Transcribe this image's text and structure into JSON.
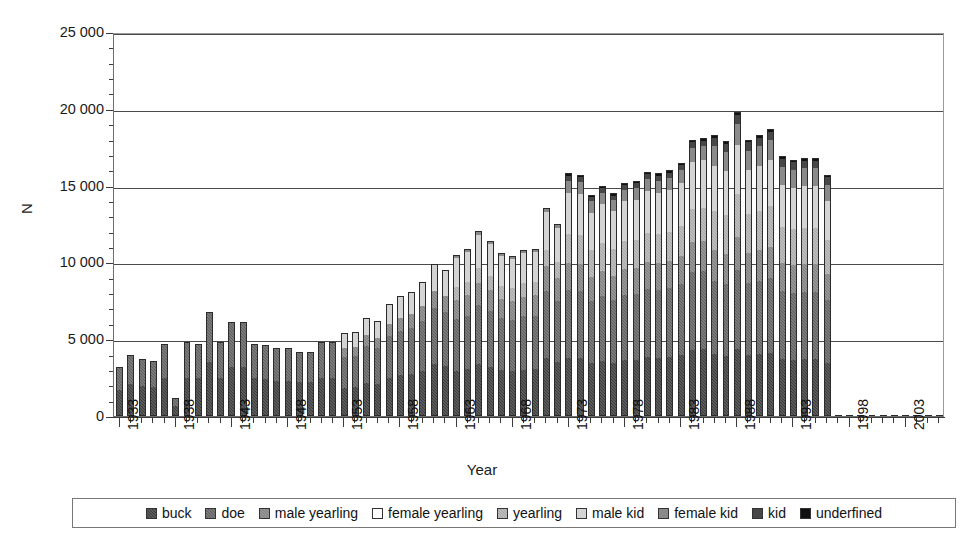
{
  "chart_data": {
    "type": "bar",
    "stacked": true,
    "title": "",
    "xlabel": "Year",
    "ylabel": "N",
    "ylim": [
      0,
      25000
    ],
    "ytick_major_step": 5000,
    "ytick_minor_step": 1000,
    "ytick_labels": [
      "0",
      "5 000",
      "10 000",
      "15 000",
      "20 000",
      "25 000"
    ],
    "grid": "horizontal",
    "legend_position": "bottom",
    "xtick_labels": [
      "1933",
      "1938",
      "1943",
      "1948",
      "1953",
      "1958",
      "1963",
      "1968",
      "1973",
      "1978",
      "1983",
      "1988",
      "1993",
      "1998",
      "2003"
    ],
    "xtick_label_step": 5,
    "x_start": 1933,
    "x_end": 2006,
    "series": [
      {
        "name": "buck",
        "key": "buck",
        "color": "#3b3b3b"
      },
      {
        "name": "doe",
        "key": "doe",
        "color": "#5e5e5e"
      },
      {
        "name": "male yearling",
        "key": "male-yearling",
        "color": "#7d7d7d"
      },
      {
        "name": "female yearling",
        "key": "female-yearling",
        "color": "#ffffff"
      },
      {
        "name": "yearling",
        "key": "yearling",
        "color": "#a7a7a7"
      },
      {
        "name": "male kid",
        "key": "male-kid",
        "color": "#d4d4d4"
      },
      {
        "name": "female kid",
        "key": "female-kid",
        "color": "#8a8a8a"
      },
      {
        "name": "kid",
        "key": "kid",
        "color": "#474747"
      },
      {
        "name": "underfined",
        "key": "underfined",
        "color": "#111111"
      }
    ],
    "categories": [
      1933,
      1934,
      1935,
      1936,
      1937,
      1938,
      1939,
      1940,
      1941,
      1942,
      1943,
      1944,
      1945,
      1946,
      1947,
      1948,
      1949,
      1950,
      1951,
      1952,
      1953,
      1954,
      1955,
      1956,
      1957,
      1958,
      1959,
      1960,
      1961,
      1962,
      1963,
      1964,
      1965,
      1966,
      1967,
      1968,
      1969,
      1970,
      1971,
      1972,
      1973,
      1974,
      1975,
      1976,
      1977,
      1978,
      1979,
      1980,
      1981,
      1982,
      1983,
      1984,
      1985,
      1986,
      1987,
      1988,
      1989,
      1990,
      1991,
      1992,
      1993,
      1994,
      1995,
      1996,
      1997,
      1998,
      1999,
      2000,
      2001,
      2002,
      2003,
      2004,
      2005,
      2006
    ],
    "totals": [
      3200,
      4000,
      3700,
      3600,
      4700,
      1200,
      4800,
      4700,
      6800,
      4800,
      6100,
      6100,
      4700,
      4600,
      4400,
      4400,
      4200,
      4200,
      4800,
      4800,
      5400,
      5500,
      6400,
      6200,
      7300,
      7800,
      8100,
      8700,
      9900,
      9500,
      10500,
      10900,
      12050,
      11400,
      10600,
      10400,
      10800,
      10900,
      13550,
      12500,
      15800,
      15700,
      14400,
      15000,
      14500,
      15200,
      15300,
      15900,
      15800,
      16000,
      16500,
      18000,
      18100,
      18300,
      17900,
      19800,
      18000,
      18300,
      18700,
      16900,
      16700,
      16800,
      16800,
      15700
    ],
    "note": "totals are stacked sums read off the y-axis; segment splits estimated per bar",
    "segments_description": "dark lower portion = buck/doe/yearling classes; light upper cap = kid classes; black tip = underfined"
  },
  "legend": {
    "items": [
      {
        "label": "buck",
        "key": "buck"
      },
      {
        "label": "doe",
        "key": "doe"
      },
      {
        "label": "male yearling",
        "key": "male-yearling"
      },
      {
        "label": "female yearling",
        "key": "female-yearling"
      },
      {
        "label": "yearling",
        "key": "yearling"
      },
      {
        "label": "male kid",
        "key": "male-kid"
      },
      {
        "label": "female kid",
        "key": "female-kid"
      },
      {
        "label": "kid",
        "key": "kid"
      },
      {
        "label": "underfined",
        "key": "underfined"
      }
    ]
  },
  "axes": {
    "y_title": "N",
    "x_title": "Year"
  }
}
